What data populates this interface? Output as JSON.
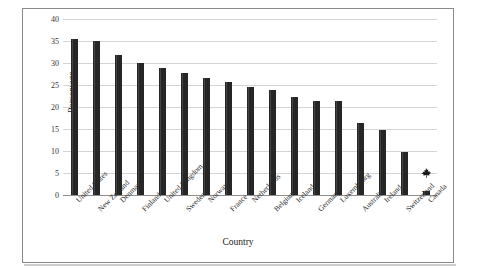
{
  "chart_data": {
    "type": "bar",
    "title": "",
    "xlabel": "Country",
    "ylabel": "Percentage",
    "ylim": [
      0,
      40
    ],
    "yticks": [
      0,
      5,
      10,
      15,
      20,
      25,
      30,
      35,
      40
    ],
    "grid": true,
    "legend": null,
    "categories": [
      "United States",
      "New Zealand",
      "Denmark",
      "Finland",
      "United Kingdom",
      "Sweden",
      "Norway",
      "France",
      "Netherlands",
      "Belgium",
      "Iceland",
      "Germany",
      "Luxembourg",
      "Australia",
      "Ireland",
      "Switzerland",
      "Canada"
    ],
    "values": [
      35.5,
      35.0,
      31.8,
      30.1,
      28.8,
      27.7,
      26.6,
      25.6,
      24.5,
      23.9,
      22.3,
      21.3,
      21.3,
      16.3,
      14.8,
      9.7,
      1.0
    ],
    "annotations": [
      {
        "category": "Canada",
        "icon": "maple-leaf-icon"
      }
    ],
    "bar_color": "#262626"
  },
  "colors": {
    "bar": "#262626",
    "grid": "#d4d4d4",
    "axis": "#8f8f8f",
    "frame": "#8a8a8a",
    "text": "#1a1a1a"
  }
}
